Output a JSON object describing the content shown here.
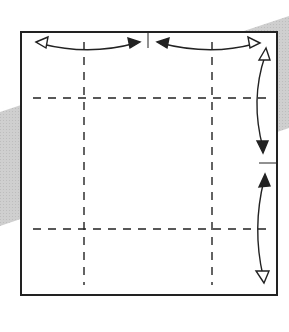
{
  "diagram": {
    "type": "origami-fold-diagram",
    "colors": {
      "background": "#ffffff",
      "band": "#c8c8c8",
      "line": "#222222"
    },
    "square": {
      "x": 21,
      "y": 32,
      "w": 256,
      "h": 263
    },
    "fold_lines": {
      "vertical_x": [
        84,
        212
      ],
      "horizontal_y": [
        98,
        229
      ]
    },
    "reference_marks": [
      {
        "orientation": "vertical",
        "x": 148,
        "y1": 32,
        "y2": 48
      },
      {
        "orientation": "horizontal",
        "y": 163,
        "x1": 259,
        "x2": 277
      }
    ],
    "arrows": [
      {
        "id": "top-left",
        "from": [
          38,
          43
        ],
        "to": [
          140,
          43
        ],
        "kind": "fold-unfold"
      },
      {
        "id": "top-right",
        "from": [
          157,
          43
        ],
        "to": [
          260,
          43
        ],
        "kind": "fold-unfold"
      },
      {
        "id": "right-upper",
        "from": [
          265,
          52
        ],
        "to": [
          263,
          152
        ],
        "kind": "fold-unfold"
      },
      {
        "id": "right-lower",
        "from": [
          264,
          176
        ],
        "to": [
          263,
          280
        ],
        "kind": "fold-unfold"
      }
    ]
  }
}
